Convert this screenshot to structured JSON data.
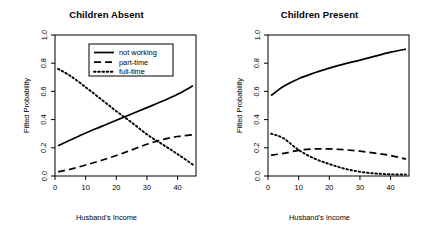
{
  "figure": {
    "width": 427,
    "height": 232,
    "background": "#ffffff",
    "line_color": "#000000",
    "axis_color": "#000000"
  },
  "chart_data": [
    {
      "type": "line",
      "title": "Children Absent",
      "xlabel": "Husband's Income",
      "ylabel": "Fitted Probability",
      "xlim": [
        0,
        46
      ],
      "ylim": [
        0.0,
        1.0
      ],
      "xticks": [
        0,
        10,
        20,
        30,
        40
      ],
      "xticklabels": [
        "0",
        "10",
        "20",
        "30",
        "40"
      ],
      "yticks": [
        0.0,
        0.2,
        0.4,
        0.6,
        0.8,
        1.0
      ],
      "yticklabels": [
        "0.0",
        "0.2",
        "0.4",
        "0.6",
        "0.8",
        "1.0"
      ],
      "grid": false,
      "legend": true,
      "legend_position": "top-center",
      "x": [
        1,
        5,
        10,
        15,
        20,
        25,
        30,
        35,
        40,
        45
      ],
      "series": [
        {
          "name": "not working",
          "linestyle": "solid",
          "values": [
            0.215,
            0.255,
            0.305,
            0.35,
            0.395,
            0.44,
            0.485,
            0.53,
            0.58,
            0.64
          ]
        },
        {
          "name": "part-time",
          "linestyle": "dashed",
          "values": [
            0.03,
            0.048,
            0.078,
            0.11,
            0.145,
            0.185,
            0.225,
            0.258,
            0.28,
            0.292
          ]
        },
        {
          "name": "full-time",
          "linestyle": "dotted",
          "values": [
            0.76,
            0.71,
            0.63,
            0.545,
            0.46,
            0.38,
            0.295,
            0.225,
            0.155,
            0.08
          ]
        }
      ]
    },
    {
      "type": "line",
      "title": "Children Present",
      "xlabel": "Husband's Income",
      "ylabel": "Fitted Probability",
      "xlim": [
        0,
        46
      ],
      "ylim": [
        0.0,
        1.0
      ],
      "xticks": [
        0,
        10,
        20,
        30,
        40
      ],
      "xticklabels": [
        "0",
        "10",
        "20",
        "30",
        "40"
      ],
      "yticks": [
        0.0,
        0.2,
        0.4,
        0.6,
        0.8,
        1.0
      ],
      "yticklabels": [
        "0.0",
        "0.2",
        "0.4",
        "0.6",
        "0.8",
        "1.0"
      ],
      "grid": false,
      "legend": false,
      "x": [
        1,
        5,
        10,
        15,
        20,
        25,
        30,
        35,
        40,
        45
      ],
      "series": [
        {
          "name": "not working",
          "linestyle": "solid",
          "values": [
            0.57,
            0.635,
            0.69,
            0.73,
            0.765,
            0.795,
            0.822,
            0.85,
            0.878,
            0.9
          ]
        },
        {
          "name": "part-time",
          "linestyle": "dashed",
          "values": [
            0.148,
            0.16,
            0.182,
            0.192,
            0.192,
            0.186,
            0.176,
            0.162,
            0.145,
            0.12
          ]
        },
        {
          "name": "full-time",
          "linestyle": "dotted",
          "values": [
            0.3,
            0.268,
            0.185,
            0.125,
            0.085,
            0.052,
            0.03,
            0.018,
            0.012,
            0.01
          ]
        }
      ]
    }
  ],
  "legend": {
    "items": [
      {
        "label": "not working",
        "style": "solid"
      },
      {
        "label": "part-time",
        "style": "dashed"
      },
      {
        "label": "full-time",
        "style": "dotted"
      }
    ]
  }
}
